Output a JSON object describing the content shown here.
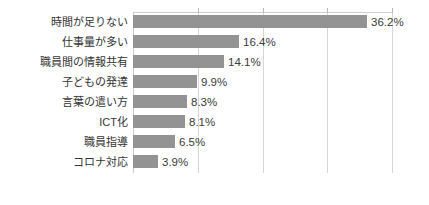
{
  "chart_data": {
    "type": "bar",
    "orientation": "horizontal",
    "title": "",
    "subtitle": "",
    "xlabel": "",
    "ylabel": "",
    "xlim": [
      0,
      40
    ],
    "grid": true,
    "gridlines": [
      10,
      20,
      30,
      40
    ],
    "legend": "none",
    "value_suffix": "%",
    "categories": [
      "時間が足りない",
      "仕事量が多い",
      "職員間の情報共有",
      "子どもの発達",
      "言葉の遣い方",
      "ICT化",
      "職員指導",
      "コロナ対応"
    ],
    "values": [
      36.2,
      16.4,
      14.1,
      9.9,
      8.3,
      8.1,
      6.5,
      3.9
    ],
    "value_labels": [
      "36.2%",
      "16.4%",
      "14.1%",
      "9.9%",
      "8.3%",
      "8.1%",
      "6.5%",
      "3.9%"
    ],
    "bar_color": "#939393",
    "grid_color": "#d6d6d6",
    "label_color": "#333333"
  }
}
